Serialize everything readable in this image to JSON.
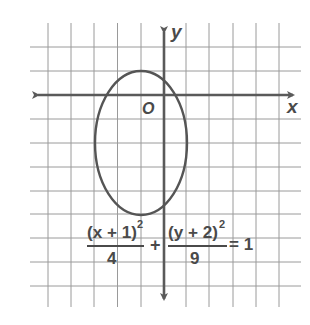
{
  "figure": {
    "axes": {
      "x_label": "x",
      "y_label": "y",
      "origin_label": "O"
    },
    "grid": {
      "x_range": [
        -6,
        5
      ],
      "y_range": [
        -8,
        3
      ],
      "step": 1
    },
    "ellipse": {
      "center": [
        -1,
        -2
      ],
      "semi_axis_x": 2,
      "semi_axis_y": 3
    },
    "equation": {
      "numerator_1": "(x + 1)",
      "exponent_1": "2",
      "denominator_1": "4",
      "plus": "+",
      "numerator_2": "(y + 2)",
      "exponent_2": "2",
      "denominator_2": "9",
      "equals": "= 1",
      "full_text": "(x + 1)^2/4 + (y + 2)^2/9 = 1"
    },
    "colors": {
      "grid": "#9a9a9a",
      "axis": "#5a5a5a",
      "curve": "#555555",
      "text": "#4a4a4a"
    }
  }
}
